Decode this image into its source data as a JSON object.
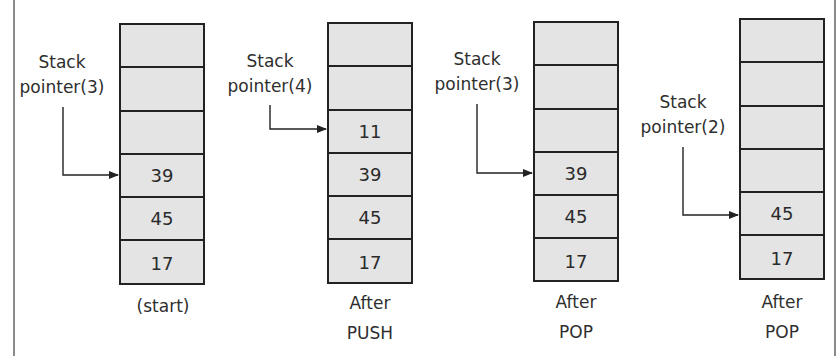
{
  "diagram": {
    "colors": {
      "cell_fill": "#e4e4e4",
      "line": "#222222",
      "frame": "#8a8a8a"
    },
    "stacks": [
      {
        "pointer_label": {
          "line1": "Stack",
          "line2": "pointer(3)"
        },
        "cells": [
          "",
          "",
          "",
          "39",
          "45",
          "17"
        ],
        "pointer_index": 3,
        "caption": {
          "line1": "(start)",
          "line2": ""
        }
      },
      {
        "pointer_label": {
          "line1": "Stack",
          "line2": "pointer(4)"
        },
        "cells": [
          "",
          "",
          "11",
          "39",
          "45",
          "17"
        ],
        "pointer_index": 2,
        "caption": {
          "line1": "After",
          "line2": "PUSH"
        }
      },
      {
        "pointer_label": {
          "line1": "Stack",
          "line2": "pointer(3)"
        },
        "cells": [
          "",
          "",
          "",
          "39",
          "45",
          "17"
        ],
        "pointer_index": 3,
        "caption": {
          "line1": "After",
          "line2": "POP"
        }
      },
      {
        "pointer_label": {
          "line1": "Stack",
          "line2": "pointer(2)"
        },
        "cells": [
          "",
          "",
          "",
          "",
          "45",
          "17"
        ],
        "pointer_index": 4,
        "caption": {
          "line1": "After",
          "line2": "POP"
        }
      }
    ]
  }
}
